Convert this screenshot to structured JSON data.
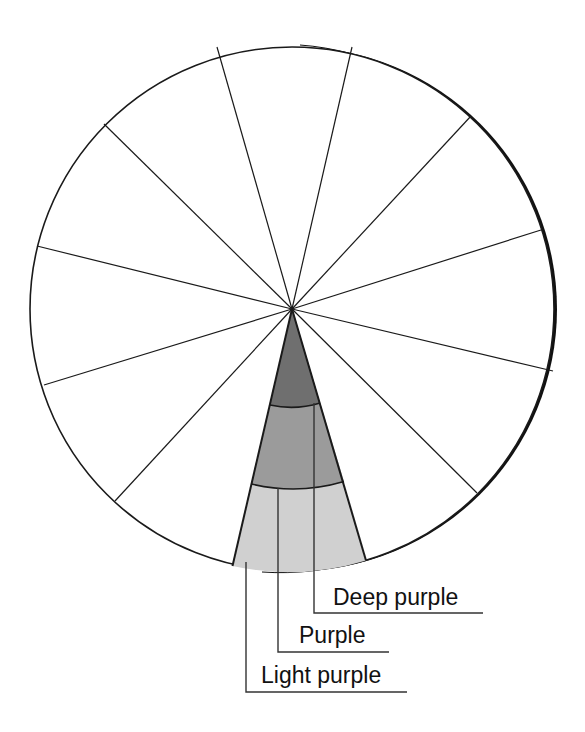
{
  "diagram": {
    "type": "color-wheel-segment",
    "center": [
      292,
      309
    ],
    "radius": 263,
    "spoke_count": 12,
    "wheel": {
      "fill": "#ffffff",
      "stroke": "#1a1a1a"
    },
    "highlighted_wedge": {
      "bands": [
        {
          "name": "Deep purple",
          "color": "#6f6f6f"
        },
        {
          "name": "Purple",
          "color": "#9b9b9b"
        },
        {
          "name": "Light purple",
          "color": "#d0d0d0"
        }
      ]
    }
  },
  "labels": {
    "deep_purple": "Deep purple",
    "purple": "Purple",
    "light_purple": "Light purple"
  }
}
